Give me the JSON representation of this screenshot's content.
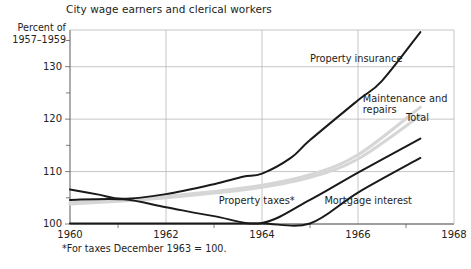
{
  "chart_data": {
    "type": "line",
    "title": "City wage earners and clerical workers",
    "xlabel": "",
    "ylabel": "Percent of 1957-1959",
    "ylabel_line1": "Percent of",
    "ylabel_line2": "1957–1959",
    "footnote": "*For taxes December 1963 = 100.",
    "xlim": [
      1960,
      1968
    ],
    "ylim": [
      100,
      137
    ],
    "grid": true,
    "legend_position": "inline-annotations",
    "x_ticks": [
      "1960",
      "1962",
      "1964",
      "1966",
      "1968"
    ],
    "x_tick_values": [
      1960,
      1962,
      1964,
      1966,
      1968
    ],
    "x_minor_ticks": [
      1961,
      1963,
      1965,
      1967
    ],
    "y_ticks": [
      "100",
      "110",
      "120",
      "130"
    ],
    "y_tick_values": [
      100,
      110,
      120,
      130
    ],
    "y_minor_ticks": [
      105,
      115,
      125,
      135
    ],
    "colors": {
      "dark_line": "#1a1a1a",
      "light_line": "#d6d6d6",
      "grid": "#b8b8b8",
      "axis": "#6f6f6f",
      "text": "#232323"
    },
    "series": [
      {
        "name": "Property insurance",
        "style": "dark",
        "x": [
          1960.0,
          1960.6,
          1961.1,
          1962.0,
          1963.0,
          1963.6,
          1964.0,
          1964.6,
          1965.0,
          1966.0,
          1966.5,
          1967.3
        ],
        "values": [
          106.6,
          105.6,
          104.8,
          105.7,
          107.6,
          109.0,
          109.6,
          112.6,
          116.0,
          123.6,
          127.3,
          136.6
        ]
      },
      {
        "name": "Maintenance and repairs",
        "style": "light",
        "x": [
          1960.0,
          1961.1,
          1962.0,
          1963.0,
          1964.0,
          1965.0,
          1966.0,
          1967.3
        ],
        "values": [
          104.1,
          104.6,
          105.3,
          106.2,
          107.4,
          109.4,
          113.2,
          122.3
        ]
      },
      {
        "name": "Total",
        "style": "light",
        "x": [
          1960.0,
          1961.1,
          1962.0,
          1963.0,
          1964.0,
          1965.0,
          1966.0,
          1967.3
        ],
        "values": [
          103.8,
          104.4,
          105.0,
          105.9,
          107.0,
          108.9,
          112.4,
          120.7
        ]
      },
      {
        "name": "Property taxes*",
        "style": "dark",
        "x": [
          1960.0,
          1961.1,
          1962.0,
          1963.0,
          1964.0,
          1965.0,
          1966.0,
          1967.3
        ],
        "values": [
          104.6,
          104.7,
          103.2,
          101.5,
          100.2,
          104.6,
          109.8,
          116.3
        ]
      },
      {
        "name": "Mortgage interest",
        "style": "dark",
        "x": [
          1960.0,
          1961.1,
          1962.0,
          1963.0,
          1964.0,
          1965.0,
          1966.0,
          1967.3
        ],
        "values": [
          100.1,
          100.1,
          100.1,
          100.1,
          100.1,
          100.1,
          106.0,
          112.6
        ]
      }
    ],
    "annotations": [
      {
        "text": "Property insurance",
        "x": 1965.0,
        "y": 131.5
      },
      {
        "text": "Maintenance and repairs",
        "x": 1966.1,
        "y": 123.9
      },
      {
        "text": "Total",
        "x": 1967.0,
        "y": 120.2
      },
      {
        "text": "Property taxes*",
        "x": 1963.1,
        "y": 104.4
      },
      {
        "text": "Mortgage interest",
        "x": 1965.3,
        "y": 104.3
      }
    ]
  }
}
